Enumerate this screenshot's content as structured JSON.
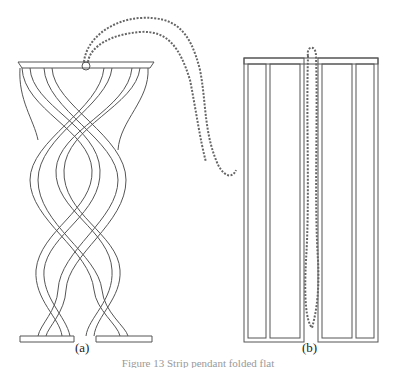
{
  "figure": {
    "panel_a": {
      "label": "(a)",
      "description": "Twisted strip lattice pendant with beaded chain"
    },
    "panel_b": {
      "label": "(b)",
      "description": "Flat unfolded strip pattern with chain"
    },
    "caption": "Figure 13  Strip pendant folded flat"
  },
  "colors": {
    "line": "#555555",
    "background": "#ffffff"
  }
}
